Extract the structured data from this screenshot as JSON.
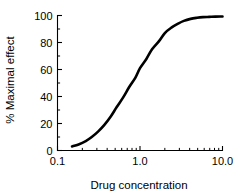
{
  "chart_data": {
    "type": "line",
    "title": "",
    "xlabel": "Drug concentration",
    "ylabel": "% Maximal effect",
    "xscale": "log",
    "yscale": "linear",
    "xlim": [
      0.1,
      10.0
    ],
    "ylim": [
      0,
      100
    ],
    "grid": false,
    "legend": null,
    "x_tick_labels": [
      "0.1",
      "1.0",
      "10.0"
    ],
    "x_tick_values": [
      0.1,
      1.0,
      10.0
    ],
    "x_minor_tick_values": [
      0.2,
      0.3,
      0.4,
      0.5,
      0.6,
      0.7,
      0.8,
      0.9,
      2,
      3,
      4,
      5,
      6,
      7,
      8,
      9
    ],
    "y_tick_labels": [
      "0",
      "20",
      "40",
      "60",
      "80",
      "100"
    ],
    "y_tick_values": [
      0,
      20,
      40,
      60,
      80,
      100
    ],
    "y_minor_tick_values": [
      10,
      30,
      50,
      70,
      90
    ],
    "series": [
      {
        "name": "dose-response",
        "color": "#000000",
        "ec50": 1.0,
        "hill_slope": 1.0,
        "emax": 100,
        "x": [
          0.15,
          0.18,
          0.22,
          0.26,
          0.31,
          0.37,
          0.44,
          0.52,
          0.62,
          0.74,
          0.88,
          1.0,
          1.2,
          1.4,
          1.7,
          2.0,
          2.4,
          2.9,
          3.4,
          4.1,
          4.9,
          5.8,
          6.9,
          8.2,
          10.0
        ],
        "y": [
          3.0,
          4.5,
          7.0,
          10.0,
          14.0,
          19.0,
          25.0,
          32.0,
          39.0,
          47.0,
          54.0,
          61.0,
          68.0,
          75.0,
          81.0,
          87.0,
          91.0,
          94.0,
          96.0,
          97.5,
          98.3,
          98.8,
          99.0,
          99.2,
          99.3
        ]
      }
    ]
  },
  "axes": {
    "x_title": "Drug concentration",
    "y_title": "% Maximal effect"
  }
}
